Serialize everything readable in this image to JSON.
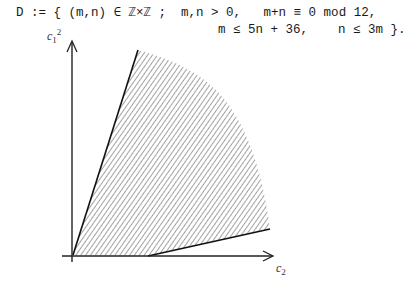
{
  "formula": {
    "line1": "D := { (m,n) ∈ ℤ×ℤ ;  m,n > 0,   m+n ≡ 0 mod 12,",
    "line2": "m ≤ 5n + 36,    n ≤ 3m }."
  },
  "axes": {
    "y_label_base": "c",
    "y_label_sub": "1",
    "y_label_sup": "2",
    "x_label_base": "c",
    "x_label_sub": "2"
  },
  "figure": {
    "type": "hatched-region",
    "hatch_color": "#555555",
    "edge_color": "#111111",
    "vertices": {
      "origin": [
        73,
        255
      ],
      "top": [
        138,
        50
      ],
      "bottom_break": [
        148,
        256
      ],
      "right": [
        270,
        229
      ]
    },
    "boundary_lines": [
      {
        "name": "n = 3m",
        "from": "origin",
        "to": "top"
      },
      {
        "name": "m = 5n + 36",
        "from": "bottom_break",
        "to": "right"
      }
    ],
    "curved_boundary": "arc from top to right (no solid edge)"
  }
}
